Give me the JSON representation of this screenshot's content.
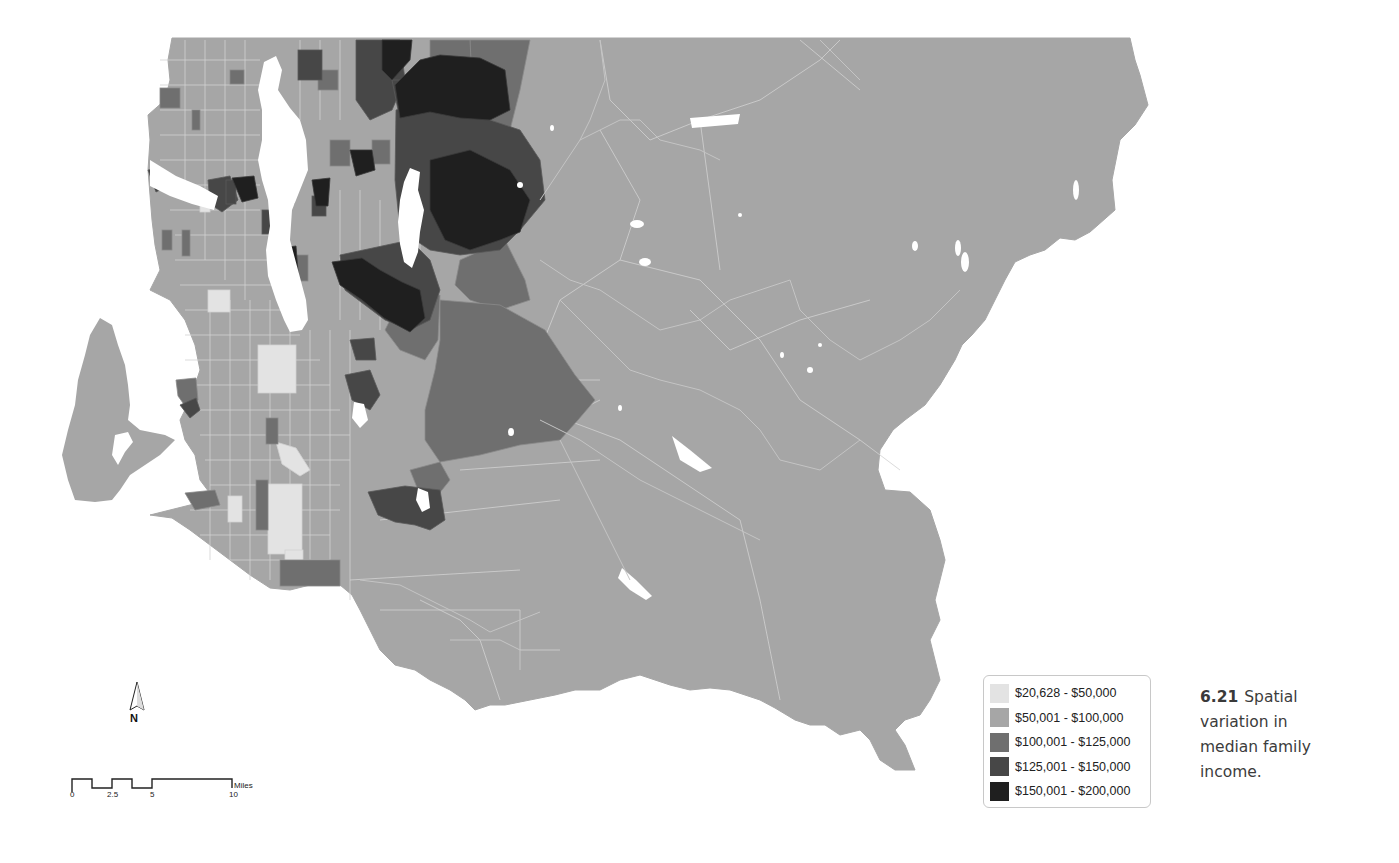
{
  "map": {
    "title": "Spatial variation in median family income",
    "colors": {
      "water": "#ffffff",
      "boundary": "#d4d4d4",
      "class1": "#e3e3e3",
      "class2": "#a6a6a6",
      "class3": "#6f6f6f",
      "class4": "#474747",
      "class5": "#1f1f1f"
    }
  },
  "legend": {
    "items": [
      {
        "label": "$20,628 - $50,000",
        "color": "#e3e3e3"
      },
      {
        "label": "$50,001 - $100,000",
        "color": "#a6a6a6"
      },
      {
        "label": "$100,001 - $125,000",
        "color": "#6f6f6f"
      },
      {
        "label": "$125,001 - $150,000",
        "color": "#474747"
      },
      {
        "label": "$150,001 - $200,000",
        "color": "#1f1f1f"
      }
    ]
  },
  "caption": {
    "figure_number": "6.21",
    "text": "Spatial variation in median family income."
  },
  "north_arrow": {
    "label": "N"
  },
  "scale_bar": {
    "ticks": [
      "0",
      "2.5",
      "5",
      "10"
    ],
    "unit": "Miles"
  }
}
